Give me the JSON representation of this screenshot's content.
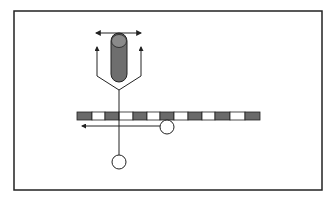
{
  "diagram": {
    "type": "schematic",
    "frame": {
      "x": 14,
      "y": 11,
      "w": 308,
      "h": 179,
      "stroke": "#222222"
    },
    "colors": {
      "line": "#222222",
      "dark_fill": "#6a6a6a",
      "cylinder_fill": "#6e6e6e",
      "cylinder_cap": "#8a8a8a",
      "light_fill": "#ffffff"
    },
    "cylinder": {
      "x": 111,
      "y": 33,
      "w": 16,
      "h": 49
    },
    "double_arrow": {
      "x1": 96,
      "x2": 141,
      "y": 33
    },
    "y_branch": {
      "left_x": 97,
      "right_x": 141,
      "arrow_top_y": 47,
      "bend_y": 76,
      "join_x": 119,
      "join_y": 90
    },
    "stem": {
      "x": 119,
      "y1": 90,
      "y2": 155
    },
    "bar": {
      "y": 112,
      "h": 8,
      "segments": [
        {
          "x": 77,
          "w": 15,
          "dark": true
        },
        {
          "x": 92,
          "w": 13,
          "dark": false
        },
        {
          "x": 105,
          "w": 14,
          "dark": true
        },
        {
          "x": 119,
          "w": 14,
          "dark": false
        },
        {
          "x": 133,
          "w": 14,
          "dark": true
        },
        {
          "x": 147,
          "w": 13,
          "dark": false
        },
        {
          "x": 160,
          "w": 14,
          "dark": true
        },
        {
          "x": 174,
          "w": 14,
          "dark": false
        },
        {
          "x": 188,
          "w": 14,
          "dark": true
        },
        {
          "x": 202,
          "w": 13,
          "dark": false
        },
        {
          "x": 215,
          "w": 15,
          "dark": true
        },
        {
          "x": 230,
          "w": 15,
          "dark": false
        },
        {
          "x": 245,
          "w": 15,
          "dark": true
        }
      ]
    },
    "left_arrow": {
      "x1": 160,
      "x2": 82,
      "y": 126
    },
    "circles": [
      {
        "name": "right-circle",
        "cx": 167,
        "cy": 127,
        "r": 7
      },
      {
        "name": "bottom-circle",
        "cx": 119,
        "cy": 162,
        "r": 7
      }
    ]
  }
}
